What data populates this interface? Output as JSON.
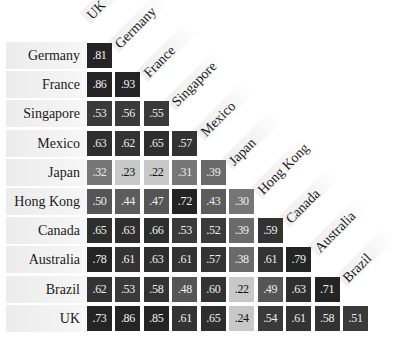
{
  "chart_data": {
    "type": "heatmap",
    "title": "",
    "subtitle": "",
    "xlabel": "",
    "ylabel": "",
    "layout": "lower-triangular correlation matrix with diagonal (45°) column labels",
    "columns": [
      "UK",
      "Germany",
      "France",
      "Singapore",
      "Mexico",
      "Japan",
      "Hong Kong",
      "Canada",
      "Australia",
      "Brazil"
    ],
    "rows": [
      "Germany",
      "France",
      "Singapore",
      "Mexico",
      "Japan",
      "Hong Kong",
      "Canada",
      "Australia",
      "Brazil",
      "UK"
    ],
    "values": [
      [
        ".81"
      ],
      [
        ".86",
        ".93"
      ],
      [
        ".53",
        ".56",
        ".55"
      ],
      [
        ".63",
        ".62",
        ".65",
        ".57"
      ],
      [
        ".32",
        ".23",
        ".22",
        ".31",
        ".39"
      ],
      [
        ".50",
        ".44",
        ".47",
        ".72",
        ".43",
        ".30"
      ],
      [
        ".65",
        ".63",
        ".66",
        ".53",
        ".52",
        ".39",
        ".59"
      ],
      [
        ".78",
        ".61",
        ".63",
        ".61",
        ".57",
        ".38",
        ".61",
        ".79"
      ],
      [
        ".62",
        ".53",
        ".58",
        ".48",
        ".60",
        ".22",
        ".49",
        ".63",
        ".71"
      ],
      [
        ".73",
        ".86",
        ".85",
        ".61",
        ".65",
        ".24",
        ".54",
        ".61",
        ".58",
        ".51"
      ]
    ],
    "numeric_values": [
      [
        0.81
      ],
      [
        0.86,
        0.93
      ],
      [
        0.53,
        0.56,
        0.55
      ],
      [
        0.63,
        0.62,
        0.65,
        0.57
      ],
      [
        0.32,
        0.23,
        0.22,
        0.31,
        0.39
      ],
      [
        0.5,
        0.44,
        0.47,
        0.72,
        0.43,
        0.3
      ],
      [
        0.65,
        0.63,
        0.66,
        0.53,
        0.52,
        0.39,
        0.59
      ],
      [
        0.78,
        0.61,
        0.63,
        0.61,
        0.57,
        0.38,
        0.61,
        0.79
      ],
      [
        0.62,
        0.53,
        0.58,
        0.48,
        0.6,
        0.22,
        0.49,
        0.63,
        0.71
      ],
      [
        0.73,
        0.86,
        0.85,
        0.61,
        0.65,
        0.24,
        0.54,
        0.61,
        0.58,
        0.51
      ]
    ],
    "color_scale": {
      "low": "#c9c9c9",
      "mid": "#6e6e6e",
      "high": "#262626",
      "text_on_light": "#111111",
      "text_on_dark": "#f2f2f2"
    },
    "legend": null,
    "grid": false
  }
}
